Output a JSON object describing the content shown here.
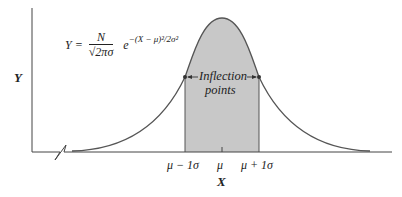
{
  "figure": {
    "type": "normal-distribution-diagram",
    "formula": {
      "lhs": "Y =",
      "numerator": "N",
      "denominator": "√2πσ",
      "base": "e",
      "exponent": "−(X − μ)²/2σ²"
    },
    "axes": {
      "y_label": "Y",
      "x_label": "X",
      "x_axis_break": true
    },
    "ticks": {
      "left": "μ − 1σ",
      "center": "μ",
      "right": "μ + 1σ"
    },
    "annotation": {
      "line1": "Inflection",
      "line2": "points"
    },
    "colors": {
      "shade": "#c8c8c8",
      "line": "#555555",
      "text": "#222222"
    },
    "shaded_region": "μ − 1σ to μ + 1σ"
  }
}
